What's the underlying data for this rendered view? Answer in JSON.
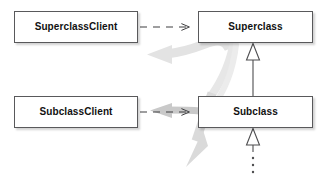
{
  "diagram": {
    "type": "uml-class-diagram",
    "background_color": "#ffffff",
    "box_border_color": "#59595b",
    "line_color": "#4d4d4f",
    "highlight_arrow_color": "#e2e2e2",
    "classes": [
      {
        "id": "superclass-client",
        "label": "SuperclassClient"
      },
      {
        "id": "superclass",
        "label": "Superclass"
      },
      {
        "id": "subclass-client",
        "label": "SubclassClient"
      },
      {
        "id": "subclass",
        "label": "Subclass"
      }
    ],
    "relationships": [
      {
        "id": "dep-superclass-client-to-superclass",
        "kind": "dependency",
        "style": "dashed-open-arrow",
        "from": "SuperclassClient",
        "to": "Superclass"
      },
      {
        "id": "dep-subclass-client-to-subclass",
        "kind": "dependency",
        "style": "dashed-open-arrow",
        "from": "SubclassClient",
        "to": "Subclass"
      },
      {
        "id": "gen-subclass-to-superclass",
        "kind": "generalization",
        "style": "solid-hollow-triangle",
        "from": "Subclass",
        "to": "Superclass"
      },
      {
        "id": "gen-further-subclasses",
        "kind": "generalization",
        "style": "dotted-hollow-triangle",
        "from": "further subclasses",
        "to": "Subclass"
      }
    ],
    "highlight_arrows": [
      {
        "id": "highlight-arrow-to-superclass-client",
        "direction": "left",
        "target": "SuperclassClient"
      },
      {
        "id": "highlight-arrow-to-subclass-client",
        "direction": "left",
        "target": "SubclassClient"
      },
      {
        "id": "highlight-arrow-down-left",
        "direction": "down-left",
        "target": "below-subclass"
      }
    ],
    "ellipsis_marker": {
      "id": "subclass-continuation-dots",
      "glyph": "vertical-dots",
      "dot_count": 3
    }
  }
}
